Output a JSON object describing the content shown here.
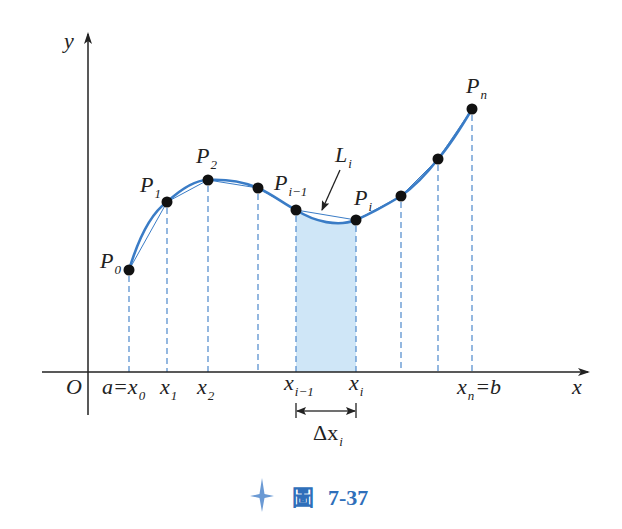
{
  "figure": {
    "caption_label": "圖",
    "caption_number": "7-37",
    "caption_icon": "four-point-star-icon",
    "colors": {
      "curve": "#3a7cc6",
      "chord": "#3a7cc6",
      "dashed": "#5b92d0",
      "shade": "#cfe6f7",
      "axis": "#222222",
      "point": "#111111",
      "caption": "#2f6fba"
    }
  },
  "axes": {
    "x_label": "x",
    "y_label": "y",
    "origin_label": "O"
  },
  "points": [
    {
      "name": "P",
      "sub": "0"
    },
    {
      "name": "P",
      "sub": "1"
    },
    {
      "name": "P",
      "sub": "2"
    },
    {
      "name": "",
      "sub": ""
    },
    {
      "name": "P",
      "sub": "i−1"
    },
    {
      "name": "P",
      "sub": "i"
    },
    {
      "name": "",
      "sub": ""
    },
    {
      "name": "",
      "sub": ""
    },
    {
      "name": "P",
      "sub": "n"
    }
  ],
  "x_ticks": [
    {
      "pre": "a=",
      "name": "x",
      "sub": "0"
    },
    {
      "pre": "",
      "name": "x",
      "sub": "1"
    },
    {
      "pre": "",
      "name": "x",
      "sub": "2"
    },
    {
      "pre": "",
      "name": "",
      "sub": ""
    },
    {
      "pre": "",
      "name": "x",
      "sub": "i−1"
    },
    {
      "pre": "",
      "name": "x",
      "sub": "i"
    },
    {
      "pre": "",
      "name": "",
      "sub": ""
    },
    {
      "pre": "",
      "name": "",
      "sub": ""
    },
    {
      "pre": "",
      "name": "x",
      "sub": "n",
      "post": "=b"
    }
  ],
  "annotations": {
    "chord_label": "L",
    "chord_sub": "i",
    "delta_label": "Δx",
    "delta_sub": "i"
  }
}
